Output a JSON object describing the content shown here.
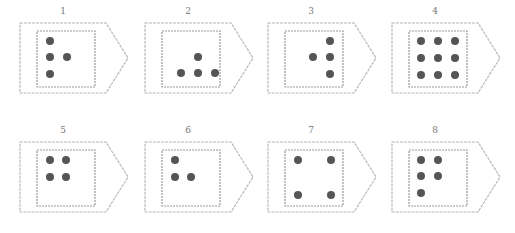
{
  "title": "",
  "colors": {
    "outline": "#b8b8b8",
    "dot": "#555555",
    "label": "#777777"
  },
  "cards": [
    {
      "label": "1",
      "x": 18,
      "y": 6,
      "dots": [
        [
          13,
          10
        ],
        [
          13,
          26
        ],
        [
          30,
          26
        ],
        [
          13,
          43
        ]
      ]
    },
    {
      "label": "2",
      "x": 143,
      "y": 6,
      "dots": [
        [
          36,
          26
        ],
        [
          19,
          42
        ],
        [
          36,
          42
        ],
        [
          53,
          42
        ]
      ]
    },
    {
      "label": "3",
      "x": 266,
      "y": 6,
      "dots": [
        [
          45,
          10
        ],
        [
          28,
          26
        ],
        [
          45,
          26
        ],
        [
          45,
          43
        ]
      ]
    },
    {
      "label": "4",
      "x": 390,
      "y": 6,
      "dots": [
        [
          12,
          10
        ],
        [
          29,
          10
        ],
        [
          46,
          10
        ],
        [
          12,
          27
        ],
        [
          29,
          27
        ],
        [
          46,
          27
        ],
        [
          12,
          44
        ],
        [
          29,
          44
        ],
        [
          46,
          44
        ]
      ]
    },
    {
      "label": "5",
      "x": 18,
      "y": 125,
      "dots": [
        [
          13,
          10
        ],
        [
          29,
          10
        ],
        [
          13,
          27
        ],
        [
          29,
          27
        ]
      ]
    },
    {
      "label": "6",
      "x": 143,
      "y": 125,
      "dots": [
        [
          13,
          10
        ],
        [
          13,
          27
        ],
        [
          29,
          27
        ]
      ]
    },
    {
      "label": "7",
      "x": 266,
      "y": 125,
      "dots": [
        [
          13,
          10
        ],
        [
          46,
          10
        ],
        [
          13,
          45
        ],
        [
          46,
          45
        ]
      ]
    },
    {
      "label": "8",
      "x": 390,
      "y": 125,
      "dots": [
        [
          12,
          10
        ],
        [
          29,
          10
        ],
        [
          12,
          26
        ],
        [
          29,
          26
        ],
        [
          12,
          43
        ]
      ]
    }
  ]
}
